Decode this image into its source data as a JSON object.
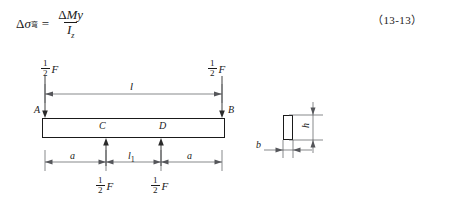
{
  "formula": {
    "delta": "Δ",
    "sigma": "σ",
    "sigma_subscript": "弯",
    "numerator_delta": "Δ",
    "numerator_M": "M",
    "numerator_y": "y",
    "denominator_I": "I",
    "denominator_sub": "z",
    "equals": "=",
    "equation_number": "（13-13）"
  },
  "beam_diagram": {
    "support_left_label": "A",
    "support_right_label": "B",
    "load_point_left_label": "C",
    "load_point_right_label": "D",
    "span_label": "l",
    "dim_left_label": "a",
    "dim_middle_label": "l",
    "dim_middle_sub": "1",
    "dim_right_label": "a",
    "reaction_left": {
      "numerator": "1",
      "denominator": "2",
      "force": "F"
    },
    "reaction_right": {
      "numerator": "1",
      "denominator": "2",
      "force": "F"
    },
    "load_left": {
      "numerator": "1",
      "denominator": "2",
      "force": "F"
    },
    "load_right": {
      "numerator": "1",
      "denominator": "2",
      "force": "F"
    }
  },
  "cross_section": {
    "width_label": "b",
    "height_label": "h"
  },
  "colors": {
    "ink": "#1a1a1a",
    "dim_line": "#55565a",
    "arrow": "#2b2b2b",
    "background": "#ffffff"
  }
}
